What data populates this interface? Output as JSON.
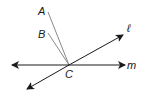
{
  "diagram": {
    "points": {
      "A": {
        "label": "A",
        "x": 48,
        "y": 12
      },
      "B": {
        "label": "B",
        "x": 48,
        "y": 33
      },
      "C": {
        "label": "C",
        "x": 69,
        "y": 65
      }
    },
    "lines": {
      "l": {
        "label": "ℓ"
      },
      "m": {
        "label": "m"
      }
    },
    "segments": [
      "AC",
      "BC"
    ],
    "colors": {
      "line": "#1a1a1a",
      "segment": "#8a8a8a"
    }
  }
}
